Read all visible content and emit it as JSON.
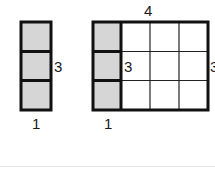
{
  "left_figure": {
    "columns": 1,
    "rows": 3,
    "height_label": "3",
    "width_label": "1",
    "fill_color": "#d6d6d6"
  },
  "right_figure": {
    "columns": 4,
    "rows": 3,
    "shaded_columns": 1,
    "top_label": "4",
    "inner_label": "3",
    "right_label": "3",
    "bottom_label": "1",
    "fill_color": "#d6d6d6"
  }
}
